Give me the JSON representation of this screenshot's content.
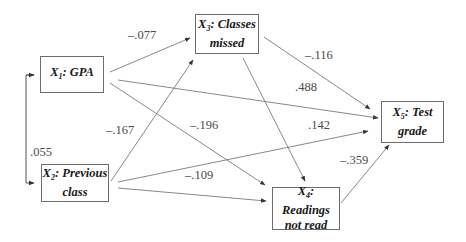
{
  "nodes": [
    {
      "id": "X1",
      "var": "X",
      "sub": "1",
      "label": ": GPA",
      "line2": "",
      "x": 40,
      "y": 56,
      "w": 64,
      "h": 37
    },
    {
      "id": "X2",
      "var": "X",
      "sub": "2",
      "label": ": Previous",
      "line2": "class",
      "x": 41,
      "y": 164,
      "w": 68,
      "h": 38
    },
    {
      "id": "X3",
      "var": "X",
      "sub": "3",
      "label": ": Classes",
      "line2": "missed",
      "x": 195,
      "y": 14,
      "w": 64,
      "h": 40
    },
    {
      "id": "X4",
      "var": "X",
      "sub": "4",
      "label": ": Readings",
      "line2": "not read",
      "x": 272,
      "y": 187,
      "w": 68,
      "h": 43
    },
    {
      "id": "X5",
      "var": "X",
      "sub": "5",
      "label": ": Test",
      "line2": "grade",
      "x": 381,
      "y": 101,
      "w": 63,
      "h": 42
    }
  ],
  "edges": [
    {
      "from": "X1",
      "to": "X3",
      "coef": "–.077",
      "x1": 110,
      "y1": 72,
      "x2": 190,
      "y2": 38,
      "lx": 128,
      "ly": 36
    },
    {
      "from": "X1",
      "to": "X5",
      "coef": ".488",
      "x1": 118,
      "y1": 80,
      "x2": 378,
      "y2": 118,
      "lx": 295,
      "ly": 88
    },
    {
      "from": "X1",
      "to": "X4",
      "coef": "–.196",
      "x1": 110,
      "y1": 83,
      "x2": 265,
      "y2": 185,
      "lx": 190,
      "ly": 126
    },
    {
      "from": "X3",
      "to": "X5",
      "coef": "–.116",
      "x1": 264,
      "y1": 37,
      "x2": 370,
      "y2": 109,
      "lx": 305,
      "ly": 56
    },
    {
      "from": "X3",
      "to": "X4",
      "coef": "",
      "x1": 243,
      "y1": 58,
      "x2": 305,
      "y2": 181,
      "lx": 0,
      "ly": 0
    },
    {
      "from": "X2",
      "to": "X3",
      "coef": "–.167",
      "x1": 111,
      "y1": 181,
      "x2": 193,
      "y2": 60,
      "lx": 106,
      "ly": 131
    },
    {
      "from": "X2",
      "to": "X5",
      "coef": ".142",
      "x1": 118,
      "y1": 182,
      "x2": 368,
      "y2": 131,
      "lx": 308,
      "ly": 126
    },
    {
      "from": "X2",
      "to": "X4",
      "coef": "–.109",
      "x1": 118,
      "y1": 188,
      "x2": 266,
      "y2": 201,
      "lx": 185,
      "ly": 176
    },
    {
      "from": "X4",
      "to": "X5",
      "coef": "–.359",
      "x1": 341,
      "y1": 203,
      "x2": 389,
      "y2": 145,
      "lx": 340,
      "ly": 161
    }
  ],
  "correlation": {
    "between": [
      "X1",
      "X2"
    ],
    "coef": ".055",
    "lx": 30,
    "ly": 120
  },
  "colors": {
    "line": "#7a7a7a",
    "border": "#6d6d6d",
    "text": "#1a1a1a",
    "coef": "#4a4a4a"
  }
}
